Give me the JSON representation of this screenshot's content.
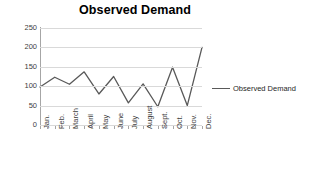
{
  "chart_data": {
    "type": "line",
    "title": "Observed Demand",
    "xlabel": "",
    "ylabel": "",
    "categories": [
      "Jan.",
      "Feb.",
      "March",
      "April",
      "May",
      "June",
      "July",
      "August",
      "Sept.",
      "Oct.",
      "Nov.",
      "Dec."
    ],
    "series": [
      {
        "name": "Observed Demand",
        "color": "#595959",
        "values": [
          98,
          123,
          105,
          137,
          80,
          125,
          57,
          106,
          47,
          149,
          50,
          200
        ]
      }
    ],
    "ylim": [
      0,
      250
    ],
    "yticks": [
      0,
      50,
      100,
      150,
      200,
      250
    ],
    "ytick_labels": [
      "0",
      "50",
      "100",
      "150",
      "200",
      "250"
    ],
    "grid": true,
    "legend": {
      "position": "right",
      "entries": [
        "Observed Demand"
      ]
    }
  },
  "colors": {
    "series_line": "#595959",
    "gridline": "#d9d9d9",
    "axis_line": "#a6a6a6",
    "title_text": "#000000",
    "tick_text": "#404040",
    "background": "#ffffff"
  }
}
